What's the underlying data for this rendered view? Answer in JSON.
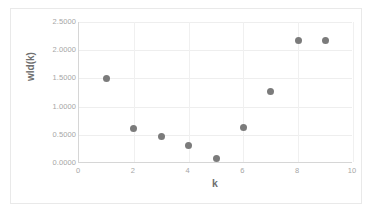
{
  "chart_data": {
    "type": "scatter",
    "title": "",
    "xlabel": "k",
    "ylabel": "wld(k)",
    "xlim": [
      0,
      10
    ],
    "ylim": [
      0,
      2.5
    ],
    "grid": true,
    "legend": "none",
    "marker_color": "#7b7b7b",
    "gridline_color": "#eeeeee",
    "axis_color": "#d6d6d6",
    "tick_label_color": "#a6a6a6",
    "axis_title_color": "#6f6f6f",
    "background_color": "#ffffff",
    "border_color": "#e9e9e9",
    "x_ticks": [
      "0",
      "2",
      "4",
      "6",
      "8",
      "10"
    ],
    "x_tick_values": [
      0,
      2,
      4,
      6,
      8,
      10
    ],
    "y_ticks": [
      "0.0000",
      "0.5000",
      "1.0000",
      "1.5000",
      "2.0000",
      "2.5000"
    ],
    "y_tick_values": [
      0.0,
      0.5,
      1.0,
      1.5,
      2.0,
      2.5
    ],
    "x": [
      1,
      2,
      3,
      4,
      5,
      6,
      7,
      8,
      9
    ],
    "y": [
      1.5,
      0.62,
      0.47,
      0.31,
      0.08,
      0.63,
      1.26,
      2.17,
      2.18
    ],
    "points": [
      {
        "k": 1,
        "wld": 1.5
      },
      {
        "k": 2,
        "wld": 0.62
      },
      {
        "k": 3,
        "wld": 0.47
      },
      {
        "k": 4,
        "wld": 0.31
      },
      {
        "k": 5,
        "wld": 0.08
      },
      {
        "k": 6,
        "wld": 0.63
      },
      {
        "k": 7,
        "wld": 1.26
      },
      {
        "k": 8,
        "wld": 2.17
      },
      {
        "k": 9,
        "wld": 2.18
      }
    ]
  }
}
